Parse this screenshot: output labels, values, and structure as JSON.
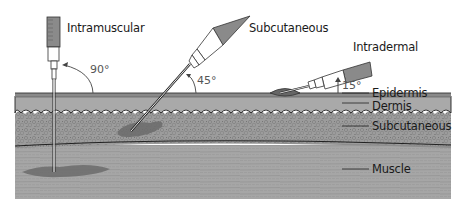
{
  "injections": [
    {
      "name": "Intramuscular",
      "angle": "90°"
    },
    {
      "name": "Subcutaneous",
      "angle": "45°"
    },
    {
      "name": "Intradermal",
      "angle": "15°"
    }
  ],
  "layers": [
    {
      "name": "Epidermis"
    },
    {
      "name": "Dermis"
    },
    {
      "name": "Subcutaneous"
    },
    {
      "name": "Muscle"
    }
  ],
  "colors": {
    "epidermis": "#8a8a8a",
    "dermis": "#a9a9a9",
    "subcutaneous": "#9c9c9c",
    "muscle": "#a6a6a6",
    "injectate": "#6b6b6b",
    "outline": "#222222"
  }
}
